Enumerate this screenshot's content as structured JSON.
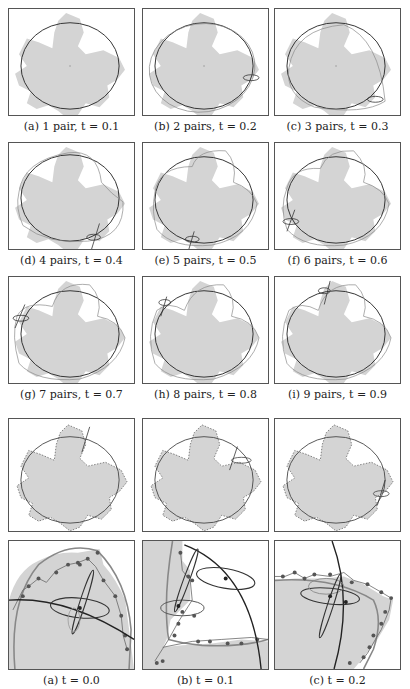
{
  "figure_top": {
    "panels": [
      {
        "label": "(a)",
        "pairs": "1 pair",
        "t": "0.1",
        "caption": "(a) 1 pair, t = 0.1"
      },
      {
        "label": "(b)",
        "pairs": "2 pairs",
        "t": "0.2",
        "caption": "(b) 2 pairs, t = 0.2"
      },
      {
        "label": "(c)",
        "pairs": "3 pairs",
        "t": "0.3",
        "caption": "(c) 3 pairs, t = 0.3"
      },
      {
        "label": "(d)",
        "pairs": "4 pairs",
        "t": "0.4",
        "caption": "(d) 4 pairs, t = 0.4"
      },
      {
        "label": "(e)",
        "pairs": "5 pairs",
        "t": "0.5",
        "caption": "(e) 5 pairs, t = 0.5"
      },
      {
        "label": "(f)",
        "pairs": "6 pairs",
        "t": "0.6",
        "caption": "(f) 6 pairs, t = 0.6"
      },
      {
        "label": "(g)",
        "pairs": "7 pairs",
        "t": "0.7",
        "caption": "(g) 7 pairs, t = 0.7"
      },
      {
        "label": "(h)",
        "pairs": "8 pairs",
        "t": "0.8",
        "caption": "(h) 8 pairs, t = 0.8"
      },
      {
        "label": "(i)",
        "pairs": "9 pairs",
        "t": "0.9",
        "caption": "(i) 9 pairs, t = 0.9"
      }
    ]
  },
  "figure_bottom": {
    "panels": [
      {
        "label": "(a)",
        "t": "0.0",
        "caption": "(a) t = 0.0"
      },
      {
        "label": "(b)",
        "t": "0.1",
        "caption": "(b) t = 0.1"
      },
      {
        "label": "(c)",
        "t": "0.2",
        "caption": "(c) t = 0.2"
      }
    ]
  },
  "colors": {
    "leaf_fill": "#d4d4d4",
    "ellipse_stroke": "#333333",
    "fourier_curve": "#888888",
    "sample_points": "#555555",
    "border": "#555555"
  }
}
